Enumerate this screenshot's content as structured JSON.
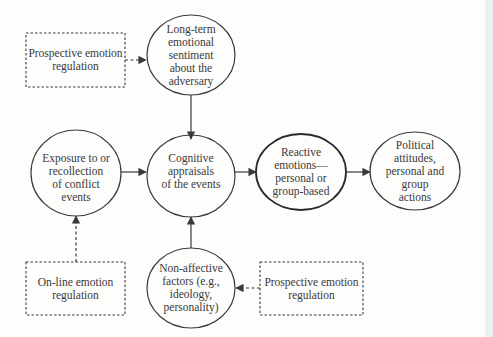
{
  "diagram": {
    "type": "flow-model",
    "nodes": [
      {
        "id": "prospective_top",
        "shape": "dashed-rect",
        "lines": [
          "Prospective emotion",
          "regulation"
        ]
      },
      {
        "id": "long_term",
        "shape": "circle",
        "lines": [
          "Long-term",
          "emotional",
          "sentiment",
          "about the",
          "adversary"
        ]
      },
      {
        "id": "exposure",
        "shape": "circle",
        "lines": [
          "Exposure to or",
          "recollection",
          "of conflict",
          "events"
        ]
      },
      {
        "id": "cognitive",
        "shape": "circle",
        "lines": [
          "Cognitive",
          "appraisals",
          "of the events"
        ]
      },
      {
        "id": "reactive",
        "shape": "ellipse-bold",
        "lines": [
          "Reactive",
          "emotions—",
          "personal or",
          "group-based"
        ]
      },
      {
        "id": "political",
        "shape": "circle",
        "lines": [
          "Political",
          "attitudes,",
          "personal and",
          "group",
          "actions"
        ]
      },
      {
        "id": "online",
        "shape": "dashed-rect",
        "lines": [
          "On-line emotion",
          "regulation"
        ]
      },
      {
        "id": "non_affective",
        "shape": "circle",
        "lines": [
          "Non-affective",
          "factors (e.g.,",
          "ideology,",
          "personality)"
        ]
      },
      {
        "id": "prospective_bottom",
        "shape": "dashed-rect",
        "lines": [
          "Prospective emotion",
          "regulation"
        ]
      }
    ],
    "edges": [
      {
        "from": "prospective_top",
        "to": "long_term",
        "style": "dashed"
      },
      {
        "from": "long_term",
        "to": "cognitive",
        "style": "solid"
      },
      {
        "from": "exposure",
        "to": "cognitive",
        "style": "solid"
      },
      {
        "from": "cognitive",
        "to": "reactive",
        "style": "solid"
      },
      {
        "from": "reactive",
        "to": "political",
        "style": "solid"
      },
      {
        "from": "online",
        "to": "exposure",
        "style": "dashed"
      },
      {
        "from": "non_affective",
        "to": "cognitive",
        "style": "solid"
      },
      {
        "from": "prospective_bottom",
        "to": "non_affective",
        "style": "dashed"
      }
    ],
    "colors": {
      "stroke": "#3a3a3a",
      "text": "#3a3a3a",
      "background": "#fdfdfc"
    }
  }
}
